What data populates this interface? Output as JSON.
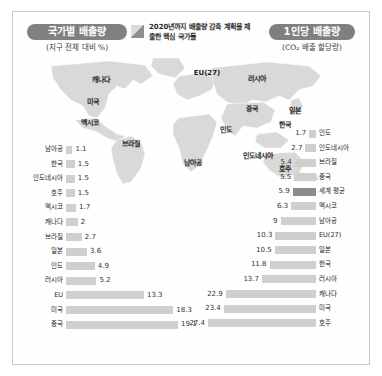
{
  "header": {
    "left_pill": "국가별 배출량",
    "left_sub": "(지구 전체 대비 %)",
    "right_pill": "1인당 배출량",
    "right_sub": "(CO₂ 배출 할당량)",
    "legend_text": "2020년까지 배출량 감축 계획을 제출한 핵심 국가들",
    "legend_icon": "diagonal-hatch-swatch"
  },
  "map": {
    "labels": [
      {
        "name": "캐나다",
        "x": 88,
        "y": 23
      },
      {
        "name": "미국",
        "x": 80,
        "y": 45
      },
      {
        "name": "멕시코",
        "x": 77,
        "y": 66
      },
      {
        "name": "EU(27)",
        "x": 194,
        "y": 17
      },
      {
        "name": "러시아",
        "x": 244,
        "y": 22
      },
      {
        "name": "중국",
        "x": 239,
        "y": 52
      },
      {
        "name": "일본",
        "x": 282,
        "y": 54
      },
      {
        "name": "한국",
        "x": 272,
        "y": 68
      },
      {
        "name": "인도",
        "x": 213,
        "y": 73
      },
      {
        "name": "브라질",
        "x": 118,
        "y": 87
      },
      {
        "name": "남아공",
        "x": 180,
        "y": 106
      },
      {
        "name": "인도네시아",
        "x": 245,
        "y": 99
      },
      {
        "name": "호주",
        "x": 272,
        "y": 112
      }
    ]
  },
  "chart_data": [
    {
      "id": "by-country",
      "type": "bar",
      "title": "국가별 배출량",
      "subtitle": "(지구 전체 대비 %)",
      "orientation": "horizontal",
      "direction": "right",
      "xlabel": "",
      "ylabel": "",
      "xlim": [
        0,
        19.1
      ],
      "grid": false,
      "legend": "none",
      "categories": [
        "남아공",
        "한국",
        "인도네시아",
        "호주",
        "멕시코",
        "캐나다",
        "브라질",
        "일본",
        "인도",
        "러시아",
        "EU",
        "미국",
        "중국"
      ],
      "values": [
        1.1,
        1.5,
        1.5,
        1.5,
        1.7,
        2,
        2.7,
        3.6,
        4.9,
        5.2,
        13.3,
        18.3,
        19.1
      ],
      "value_labels": [
        "1.1",
        "1.5",
        "1.5",
        "1.5",
        "1.7",
        "2",
        "2.7",
        "3.6",
        "4.9",
        "5.2",
        "13.3",
        "18.3",
        "19.1"
      ]
    },
    {
      "id": "per-capita",
      "type": "bar",
      "title": "1인당 배출량",
      "subtitle": "(CO₂ 배출 할당량)",
      "orientation": "horizontal",
      "direction": "left",
      "xlabel": "",
      "ylabel": "",
      "xlim": [
        0,
        27.4
      ],
      "grid": false,
      "legend": "none",
      "highlight_category": "세계 평균",
      "categories": [
        "인도",
        "인도네시아",
        "브라질",
        "중국",
        "세계 평균",
        "멕시코",
        "남아공",
        "EU(27)",
        "일본",
        "한국",
        "러시아",
        "캐나다",
        "미국",
        "호주"
      ],
      "values": [
        1.7,
        2.7,
        5.4,
        5.5,
        5.9,
        6.3,
        9,
        10.3,
        10.5,
        11.8,
        13.7,
        22.9,
        23.4,
        27.4
      ],
      "value_labels": [
        "1.7",
        "2.7",
        "5.4",
        "5.5",
        "5.9",
        "6.3",
        "9",
        "10.3",
        "10.5",
        "11.8",
        "13.7",
        "22.9",
        "23.4",
        "27.4"
      ]
    }
  ],
  "colors": {
    "pill": "#808080",
    "bar": "#cfcfcf",
    "bar_highlight": "#8c8c8c",
    "map_land": "#d5d5d5",
    "map_key": "#bdbdbd"
  }
}
